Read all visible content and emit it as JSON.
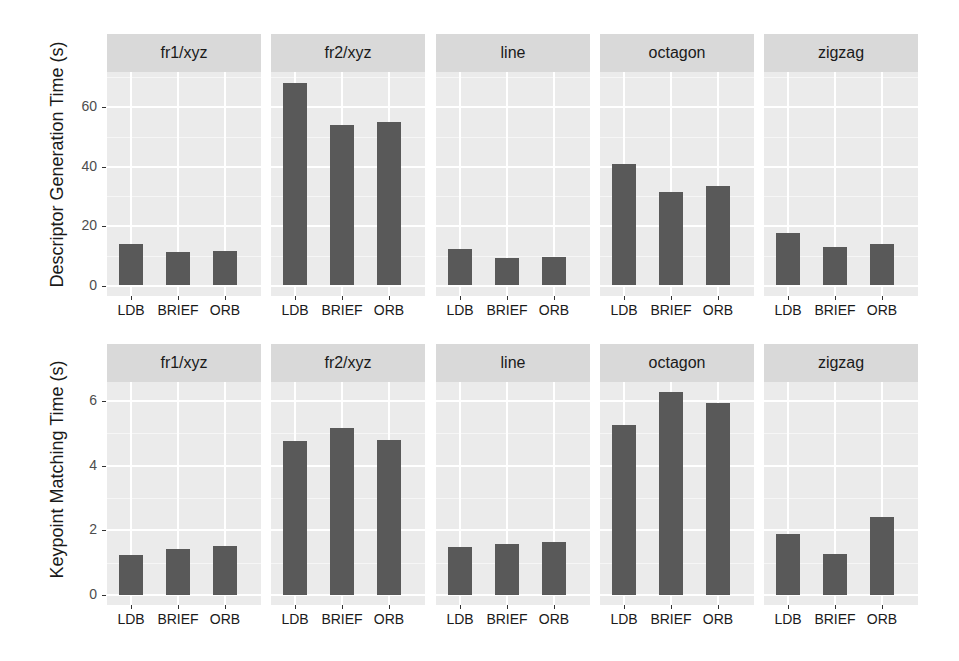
{
  "chart_data": [
    {
      "type": "bar",
      "title": "",
      "xlabel": "",
      "ylabel": "Descriptor Generation Time (s)",
      "facets": [
        "fr1/xyz",
        "fr2/xyz",
        "line",
        "octagon",
        "zigzag"
      ],
      "categories": [
        "LDB",
        "BRIEF",
        "ORB"
      ],
      "yticks": [
        0,
        20,
        40,
        60
      ],
      "ylim": [
        -3.5,
        72
      ],
      "grid": true,
      "legend": "none",
      "series": [
        {
          "name": "fr1/xyz",
          "values": [
            14.0,
            11.2,
            11.5
          ]
        },
        {
          "name": "fr2/xyz",
          "values": [
            68.1,
            54.1,
            54.8
          ]
        },
        {
          "name": "line",
          "values": [
            12.4,
            9.2,
            9.7
          ]
        },
        {
          "name": "octagon",
          "values": [
            40.7,
            31.3,
            33.4
          ]
        },
        {
          "name": "zigzag",
          "values": [
            17.6,
            13.0,
            13.8
          ]
        }
      ]
    },
    {
      "type": "bar",
      "title": "",
      "xlabel": "",
      "ylabel": "Keypoint Matching Time (s)",
      "facets": [
        "fr1/xyz",
        "fr2/xyz",
        "line",
        "octagon",
        "zigzag"
      ],
      "categories": [
        "LDB",
        "BRIEF",
        "ORB"
      ],
      "yticks": [
        0,
        2,
        4,
        6
      ],
      "ylim": [
        -0.3,
        6.6
      ],
      "grid": true,
      "legend": "none",
      "series": [
        {
          "name": "fr1/xyz",
          "values": [
            1.24,
            1.42,
            1.53
          ]
        },
        {
          "name": "fr2/xyz",
          "values": [
            4.75,
            5.18,
            4.79
          ]
        },
        {
          "name": "line",
          "values": [
            1.5,
            1.57,
            1.63
          ]
        },
        {
          "name": "octagon",
          "values": [
            5.26,
            6.29,
            5.93
          ]
        },
        {
          "name": "zigzag",
          "values": [
            1.88,
            1.27,
            2.41
          ]
        }
      ]
    }
  ],
  "colors": {
    "bar": "#595959",
    "panel_bg": "#ebebeb",
    "strip_bg": "#d9d9d9",
    "grid": "#ffffff"
  }
}
